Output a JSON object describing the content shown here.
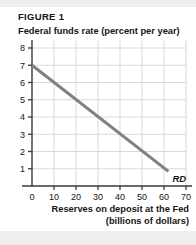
{
  "figure": {
    "label": "FIGURE 1"
  },
  "axes": {
    "y_title": "Federal funds rate (percent per year)",
    "x_title_line1": "Reserves on deposit at the Fed",
    "x_title_line2": "(billions of dollars)",
    "origin_label": "0"
  },
  "colors": {
    "curve": "#808080",
    "axis": "#3a3a3a",
    "grid": "#d9d9d9",
    "text": "#151515",
    "band": "#f0efed"
  },
  "chart_data": {
    "type": "line",
    "title": "FIGURE 1",
    "xlabel": "Reserves on deposit at the Fed (billions of dollars)",
    "ylabel": "Federal funds rate (percent per year)",
    "xlim": [
      0,
      70
    ],
    "ylim": [
      0,
      8
    ],
    "xticks": [
      0,
      10,
      20,
      30,
      40,
      50,
      60,
      70
    ],
    "xtick_labels": [
      "0",
      "10",
      "20",
      "30",
      "40",
      "50",
      "60",
      "70"
    ],
    "yticks": [
      1,
      2,
      3,
      4,
      5,
      6,
      7,
      8
    ],
    "ytick_labels": [
      "1",
      "2",
      "3",
      "4",
      "5",
      "6",
      "7",
      "8"
    ],
    "grid": true,
    "legend": "none",
    "series": [
      {
        "name": "RD",
        "label": "RD",
        "annotation": "RD",
        "color": "#808080",
        "x": [
          0,
          62
        ],
        "y": [
          7,
          0.85
        ],
        "points": [
          [
            0,
            7
          ],
          [
            10,
            6.01
          ],
          [
            20,
            5.01
          ],
          [
            30,
            4.03
          ],
          [
            40,
            3.04
          ],
          [
            50,
            2.05
          ],
          [
            60,
            1.06
          ],
          [
            62,
            0.85
          ]
        ]
      }
    ]
  }
}
